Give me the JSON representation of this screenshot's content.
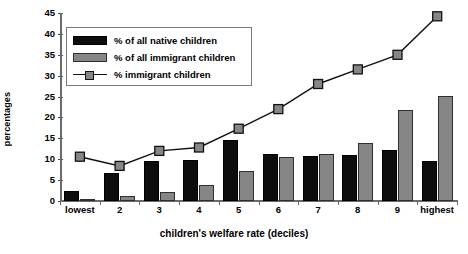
{
  "chart_data": {
    "type": "bar",
    "title": "",
    "xlabel": "children's welfare rate (deciles)",
    "ylabel": "percentages",
    "categories": [
      "lowest",
      "2",
      "3",
      "4",
      "5",
      "6",
      "7",
      "8",
      "9",
      "highest"
    ],
    "ylim": [
      0,
      45
    ],
    "yticks": [
      0,
      5,
      10,
      15,
      20,
      25,
      30,
      35,
      40,
      45
    ],
    "grid": false,
    "legend_position": "top-left",
    "series": [
      {
        "name": "% of all native children",
        "render": "bar",
        "color": "#0d0d0d",
        "values": [
          2.5,
          6.7,
          9.5,
          9.8,
          14.7,
          11.3,
          10.8,
          11.0,
          12.2,
          9.6
        ]
      },
      {
        "name": "% of all immigrant children",
        "render": "bar",
        "color": "#868686",
        "values": [
          0.5,
          1.2,
          2.2,
          3.8,
          7.2,
          10.6,
          11.3,
          13.8,
          21.8,
          25.2
        ]
      },
      {
        "name": "% immigrant children",
        "render": "line",
        "color": "#111111",
        "marker_color": "#868686",
        "values": [
          10.6,
          8.4,
          12.0,
          12.8,
          17.3,
          22.0,
          28.0,
          31.5,
          35.0,
          44.2
        ]
      }
    ]
  },
  "axes": {
    "y_title": "percentages",
    "x_title": "children's welfare rate (deciles)",
    "y_tick_labels": [
      "0",
      "5",
      "10",
      "15",
      "20",
      "25",
      "30",
      "35",
      "40",
      "45"
    ],
    "x_tick_labels": [
      "lowest",
      "2",
      "3",
      "4",
      "5",
      "6",
      "7",
      "8",
      "9",
      "highest"
    ]
  },
  "legend": {
    "entries": [
      {
        "label": "% of all native children",
        "type": "bar-black"
      },
      {
        "label": "% of all immigrant children",
        "type": "bar-grey"
      },
      {
        "label": "% immigrant children",
        "type": "line-marker"
      }
    ]
  }
}
